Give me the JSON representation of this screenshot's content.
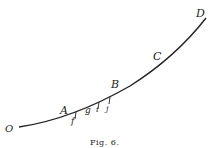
{
  "figure": {
    "caption": "Fig. 6.",
    "curve": "O-D",
    "points": [
      {
        "id": "O",
        "label": "O"
      },
      {
        "id": "A",
        "label": "A"
      },
      {
        "id": "f",
        "label": "f"
      },
      {
        "id": "g",
        "label": "g"
      },
      {
        "id": "i",
        "label": "i"
      },
      {
        "id": "j",
        "label": "j"
      },
      {
        "id": "B",
        "label": "B"
      },
      {
        "id": "C",
        "label": "C"
      },
      {
        "id": "D",
        "label": "D"
      }
    ],
    "colors": {
      "ink": "#222222",
      "background": "#ffffff"
    }
  }
}
